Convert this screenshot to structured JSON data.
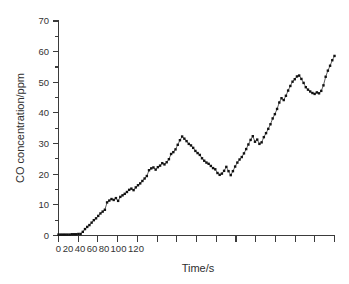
{
  "chart_data": {
    "type": "line",
    "title": "",
    "xlabel": "Time/s",
    "ylabel": "CO concentration/ppm",
    "xlim": [
      0,
      340
    ],
    "ylim": [
      0,
      70
    ],
    "ytick_values": [
      0,
      10,
      20,
      30,
      40,
      50,
      60,
      70
    ],
    "ytick_labels": [
      "0",
      "10",
      "20",
      "30",
      "40",
      "50",
      "60",
      "70"
    ],
    "xtick_values": [
      0,
      20,
      40,
      60,
      80,
      100,
      120
    ],
    "xtick_labels": [
      "0",
      "20",
      "40",
      "60",
      "80",
      "100",
      "120"
    ],
    "xtick_label_text_crowded": "020406080100120",
    "grid": false,
    "legend": null,
    "marker": "square",
    "marker_size_px": 2.4,
    "line_color": "#2a2a2a",
    "marker_color": "#111111",
    "series": [
      {
        "name": "CO concentration",
        "x": [
          0,
          3,
          6,
          9,
          12,
          15,
          18,
          21,
          24,
          27,
          30,
          33,
          36,
          39,
          42,
          45,
          48,
          51,
          54,
          57,
          60,
          63,
          66,
          69,
          72,
          75,
          78,
          81,
          84,
          87,
          90,
          93,
          96,
          99,
          102,
          105,
          108,
          111,
          114,
          117,
          120,
          123,
          126,
          129,
          132,
          135,
          138,
          141,
          144,
          147,
          150,
          153,
          156,
          159,
          162,
          165,
          168,
          171,
          174,
          177,
          180,
          183,
          186,
          189,
          192,
          195,
          198,
          201,
          204,
          207,
          210,
          213,
          216,
          219,
          222,
          225,
          228,
          231,
          234,
          237,
          240,
          243,
          246,
          249,
          252,
          255,
          258,
          261,
          264,
          267,
          270,
          273,
          276,
          279,
          282,
          285,
          288,
          291,
          294,
          297,
          300,
          303,
          306,
          309,
          312,
          315,
          318,
          321
        ],
        "y": [
          0.3,
          0.3,
          0.3,
          0.3,
          0.3,
          0.3,
          0.4,
          0.4,
          0.4,
          0.5,
          0.5,
          1.2,
          2.1,
          2.8,
          3.4,
          4.2,
          5.0,
          5.6,
          6.4,
          7.2,
          7.8,
          8.4,
          10.8,
          11.4,
          11.9,
          11.6,
          12.2,
          11.3,
          12.6,
          13.1,
          13.6,
          14.2,
          14.9,
          15.3,
          14.8,
          15.7,
          16.4,
          17.0,
          17.8,
          18.6,
          19.4,
          21.3,
          21.9,
          22.2,
          21.5,
          22.3,
          22.8,
          23.6,
          23.2,
          23.9,
          24.9,
          26.6,
          27.2,
          28.1,
          29.6,
          31.1,
          32.3,
          31.6,
          30.8,
          29.9,
          29.4,
          28.6,
          27.6,
          26.9,
          26.3,
          25.2,
          24.4,
          23.8,
          23.4,
          22.7,
          22.0,
          21.6,
          20.4,
          19.8,
          20.2,
          21.1,
          22.4,
          21.0,
          19.7,
          21.0,
          22.5,
          23.8,
          24.8,
          25.6,
          26.8,
          28.2,
          29.7,
          31.2,
          32.4,
          30.6,
          31.3,
          29.9,
          30.4,
          32.1,
          33.4,
          34.8,
          36.3,
          38.2,
          39.6,
          41.3,
          43.4,
          44.8,
          44.2,
          45.6,
          47.3,
          48.8,
          50.2,
          51.0
        ]
      }
    ],
    "series_tail": {
      "x": [
        324,
        327,
        330,
        333,
        336,
        339,
        342,
        345,
        348,
        351,
        354,
        357,
        360,
        363,
        366,
        369,
        372,
        375
      ],
      "y": [
        51.9,
        52.2,
        51.1,
        49.8,
        48.4,
        47.6,
        47.0,
        46.5,
        46.2,
        46.7,
        46.4,
        47.2,
        49.0,
        51.8,
        53.8,
        55.4,
        57.2,
        58.6
      ]
    }
  },
  "axis": {
    "y_title": "CO concentration/ppm",
    "x_title": "Time/s"
  }
}
